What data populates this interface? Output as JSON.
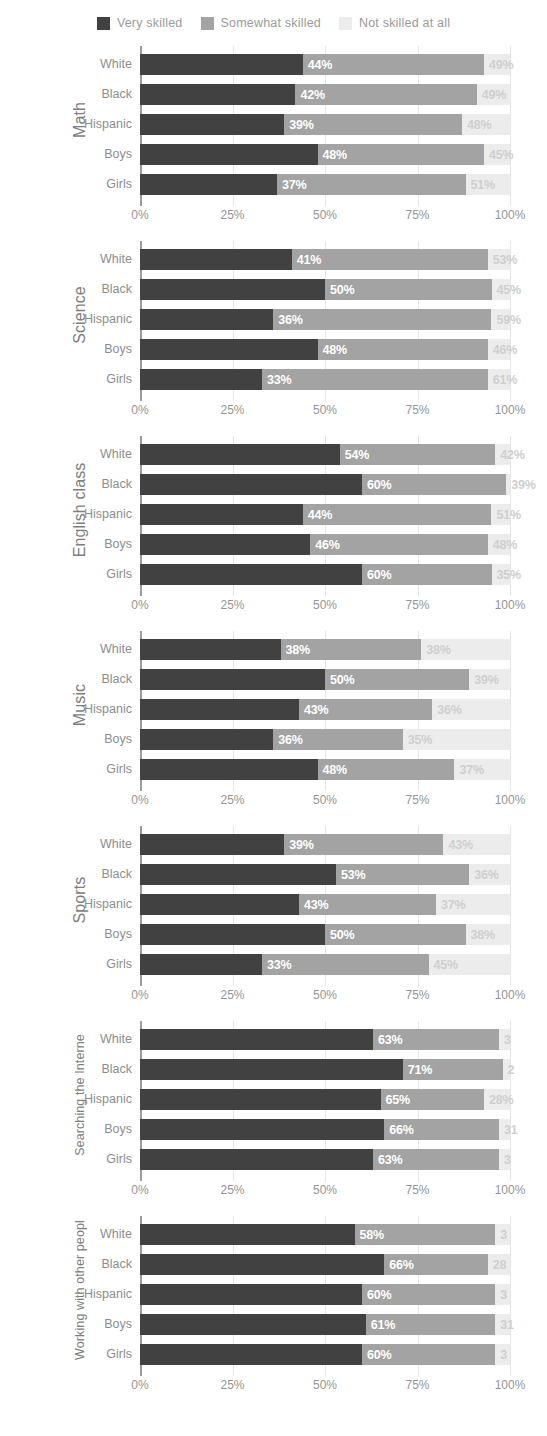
{
  "legend": {
    "items": [
      {
        "label": "Very skilled",
        "color": "#414141",
        "icon": "square-swatch"
      },
      {
        "label": "Somewhat skilled",
        "color": "#a3a3a3",
        "icon": "square-swatch"
      },
      {
        "label": "Not skilled at all",
        "color": "#ececec",
        "icon": "square-swatch"
      }
    ]
  },
  "axis": {
    "ticks": [
      "0%",
      "25%",
      "50%",
      "75%",
      "100%"
    ],
    "tick_values": [
      0,
      25,
      50,
      75,
      100
    ],
    "min": 0,
    "max": 100
  },
  "categories": [
    "White",
    "Black",
    "Hispanic",
    "Boys",
    "Girls"
  ],
  "chart_data": {
    "type": "bar",
    "subtype": "stacked-horizontal-bar",
    "orientation": "horizontal",
    "stacked": true,
    "title": "",
    "xlabel": "",
    "ylabel": "",
    "xlim": [
      0,
      100
    ],
    "grid": true,
    "legend_position": "top-center",
    "categories": [
      "White",
      "Black",
      "Hispanic",
      "Boys",
      "Girls"
    ],
    "series": [
      {
        "name": "Very skilled",
        "color": "#414141"
      },
      {
        "name": "Somewhat skilled",
        "color": "#a3a3a3"
      },
      {
        "name": "Not skilled at all",
        "color": "#ececec"
      }
    ],
    "panels": [
      {
        "title": "Math",
        "rows": [
          {
            "category": "White",
            "values": [
              44,
              49,
              7
            ],
            "labels": [
              "",
              "44%",
              "49%"
            ]
          },
          {
            "category": "Black",
            "values": [
              42,
              49,
              9
            ],
            "labels": [
              "",
              "42%",
              "49%"
            ]
          },
          {
            "category": "Hispanic",
            "values": [
              39,
              48,
              13
            ],
            "labels": [
              "",
              "39%",
              "48%"
            ]
          },
          {
            "category": "Boys",
            "values": [
              48,
              45,
              7
            ],
            "labels": [
              "",
              "48%",
              "45%"
            ]
          },
          {
            "category": "Girls",
            "values": [
              37,
              51,
              12
            ],
            "labels": [
              "",
              "37%",
              "51%"
            ]
          }
        ]
      },
      {
        "title": "Science",
        "rows": [
          {
            "category": "White",
            "values": [
              41,
              53,
              6
            ],
            "labels": [
              "",
              "41%",
              "53%"
            ]
          },
          {
            "category": "Black",
            "values": [
              50,
              45,
              5
            ],
            "labels": [
              "",
              "50%",
              "45%"
            ]
          },
          {
            "category": "Hispanic",
            "values": [
              36,
              59,
              5
            ],
            "labels": [
              "",
              "36%",
              "59%"
            ]
          },
          {
            "category": "Boys",
            "values": [
              48,
              46,
              6
            ],
            "labels": [
              "",
              "48%",
              "46%"
            ]
          },
          {
            "category": "Girls",
            "values": [
              33,
              61,
              6
            ],
            "labels": [
              "",
              "33%",
              "61%"
            ]
          }
        ]
      },
      {
        "title": "English class",
        "rows": [
          {
            "category": "White",
            "values": [
              54,
              42,
              4
            ],
            "labels": [
              "",
              "54%",
              "42%"
            ]
          },
          {
            "category": "Black",
            "values": [
              60,
              39,
              1
            ],
            "labels": [
              "",
              "60%",
              "39%"
            ]
          },
          {
            "category": "Hispanic",
            "values": [
              44,
              51,
              5
            ],
            "labels": [
              "",
              "44%",
              "51%"
            ]
          },
          {
            "category": "Boys",
            "values": [
              46,
              48,
              6
            ],
            "labels": [
              "",
              "46%",
              "48%"
            ]
          },
          {
            "category": "Girls",
            "values": [
              60,
              35,
              5
            ],
            "labels": [
              "",
              "60%",
              "35%"
            ]
          }
        ]
      },
      {
        "title": "Music",
        "rows": [
          {
            "category": "White",
            "values": [
              38,
              38,
              24
            ],
            "labels": [
              "",
              "38%",
              "38%"
            ]
          },
          {
            "category": "Black",
            "values": [
              50,
              39,
              11
            ],
            "labels": [
              "",
              "50%",
              "39%"
            ]
          },
          {
            "category": "Hispanic",
            "values": [
              43,
              36,
              21
            ],
            "labels": [
              "",
              "43%",
              "36%"
            ]
          },
          {
            "category": "Boys",
            "values": [
              36,
              35,
              29
            ],
            "labels": [
              "",
              "36%",
              "35%"
            ]
          },
          {
            "category": "Girls",
            "values": [
              48,
              37,
              15
            ],
            "labels": [
              "",
              "48%",
              "37%"
            ]
          }
        ]
      },
      {
        "title": "Sports",
        "rows": [
          {
            "category": "White",
            "values": [
              39,
              43,
              18
            ],
            "labels": [
              "",
              "39%",
              "43%"
            ]
          },
          {
            "category": "Black",
            "values": [
              53,
              36,
              11
            ],
            "labels": [
              "",
              "53%",
              "36%"
            ]
          },
          {
            "category": "Hispanic",
            "values": [
              43,
              37,
              20
            ],
            "labels": [
              "",
              "43%",
              "37%"
            ]
          },
          {
            "category": "Boys",
            "values": [
              50,
              38,
              12
            ],
            "labels": [
              "",
              "50%",
              "38%"
            ]
          },
          {
            "category": "Girls",
            "values": [
              33,
              45,
              22
            ],
            "labels": [
              "",
              "33%",
              "45%"
            ]
          }
        ]
      },
      {
        "title": "Searching the Interne",
        "title_size": "small",
        "rows": [
          {
            "category": "White",
            "values": [
              63,
              34,
              3
            ],
            "labels": [
              "",
              "63%",
              "3"
            ]
          },
          {
            "category": "Black",
            "values": [
              71,
              27,
              2
            ],
            "labels": [
              "",
              "71%",
              "2"
            ]
          },
          {
            "category": "Hispanic",
            "values": [
              65,
              28,
              7
            ],
            "labels": [
              "",
              "65%",
              "28%"
            ]
          },
          {
            "category": "Boys",
            "values": [
              66,
              31,
              3
            ],
            "labels": [
              "",
              "66%",
              "31"
            ]
          },
          {
            "category": "Girls",
            "values": [
              63,
              34,
              3
            ],
            "labels": [
              "",
              "63%",
              "3"
            ]
          }
        ]
      },
      {
        "title": "Working with other peopl",
        "title_size": "small",
        "rows": [
          {
            "category": "White",
            "values": [
              58,
              38,
              4
            ],
            "labels": [
              "",
              "58%",
              "3"
            ]
          },
          {
            "category": "Black",
            "values": [
              66,
              28,
              6
            ],
            "labels": [
              "",
              "66%",
              "28"
            ]
          },
          {
            "category": "Hispanic",
            "values": [
              60,
              36,
              4
            ],
            "labels": [
              "",
              "60%",
              "3"
            ]
          },
          {
            "category": "Boys",
            "values": [
              61,
              35,
              4
            ],
            "labels": [
              "",
              "61%",
              "31"
            ]
          },
          {
            "category": "Girls",
            "values": [
              60,
              36,
              4
            ],
            "labels": [
              "",
              "60%",
              "3"
            ]
          }
        ]
      }
    ]
  }
}
